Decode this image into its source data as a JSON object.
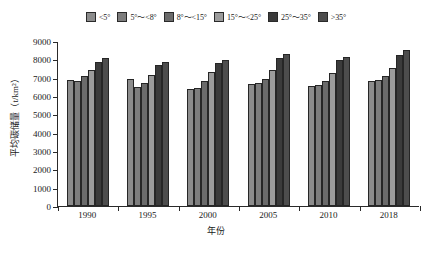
{
  "chart_data": {
    "type": "bar",
    "title": "",
    "subtitle": "",
    "xlabel": "年份",
    "ylabel": "平均碳储量（t/km²）",
    "categories": [
      "1990",
      "1995",
      "2000",
      "2005",
      "2010",
      "2018"
    ],
    "ylim": [
      0,
      9000
    ],
    "ytick_step": 1000,
    "yticks": [
      "0",
      "1000",
      "2000",
      "3000",
      "4000",
      "5000",
      "6000",
      "7000",
      "8000",
      "9000"
    ],
    "grid": false,
    "legend_position": "top",
    "orientation": "vertical",
    "series": [
      {
        "name": "<5°",
        "color": "#8c8c8c",
        "values": [
          6900,
          6950,
          6400,
          6650,
          6550,
          6800
        ]
      },
      {
        "name": "5°～<8°",
        "color": "#7d7d7d",
        "values": [
          6800,
          6500,
          6450,
          6700,
          6600,
          6850
        ]
      },
      {
        "name": "8°～<15°",
        "color": "#6b6b6b",
        "values": [
          7100,
          6700,
          6800,
          6950,
          6800,
          7100
        ]
      },
      {
        "name": "15°～<25°",
        "color": "#9c9c9c",
        "values": [
          7400,
          7150,
          7300,
          7400,
          7250,
          7550
        ]
      },
      {
        "name": "25°～35°",
        "color": "#3b3b3b",
        "values": [
          7850,
          7700,
          7800,
          8100,
          7950,
          8250
        ]
      },
      {
        "name": ">35°",
        "color": "#4d4d4d",
        "values": [
          8050,
          7850,
          7950,
          8300,
          8150,
          8500
        ]
      }
    ]
  },
  "legend": {
    "items": [
      {
        "label": "<5°",
        "color": "#8c8c8c"
      },
      {
        "label": "5°～<8°",
        "color": "#7d7d7d"
      },
      {
        "label": "8°～<15°",
        "color": "#6b6b6b"
      },
      {
        "label": "15°～<25°",
        "color": "#9c9c9c"
      },
      {
        "label": "25°～35°",
        "color": "#3b3b3b"
      },
      {
        "label": ">35°",
        "color": "#4d4d4d"
      }
    ]
  },
  "axes": {
    "x_title": "年份",
    "y_title": "平均碳储量（t/km²）"
  }
}
